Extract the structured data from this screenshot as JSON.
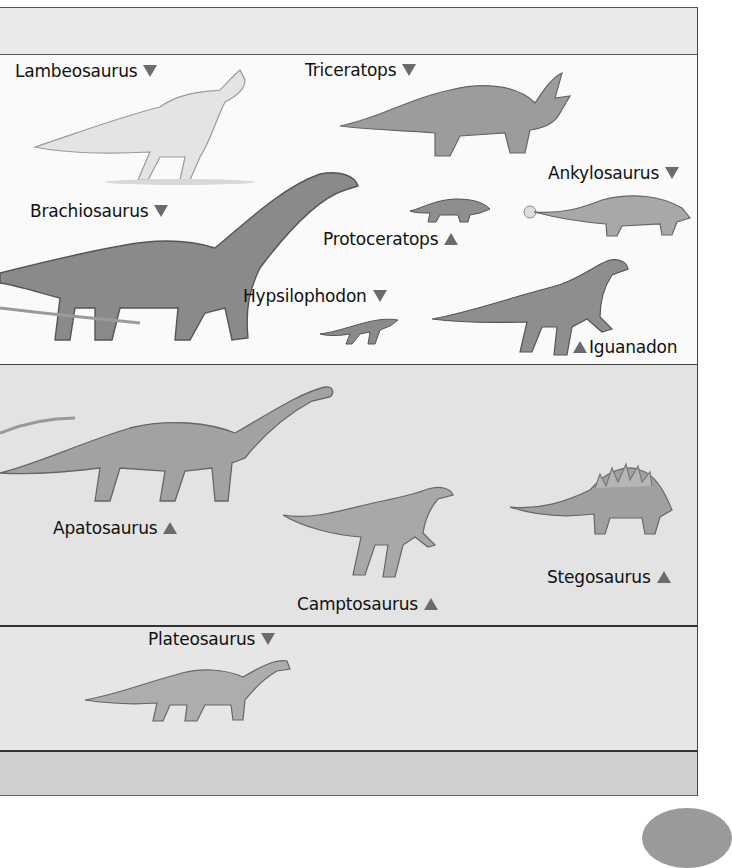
{
  "colors": {
    "arrow": "#6b6b6b",
    "label_text": "#111111",
    "band_top": "#eaeaea",
    "band_1": "#fafafa",
    "band_2": "#e3e3e3",
    "band_3": "#e6e6e6",
    "band_4": "#cfcfcf"
  },
  "bands": [
    {
      "id": "band-1",
      "labels": [
        {
          "name": "Lambeosaurus",
          "arrow": "down"
        },
        {
          "name": "Triceratops",
          "arrow": "down"
        },
        {
          "name": "Ankylosaurus",
          "arrow": "down"
        },
        {
          "name": "Brachiosaurus",
          "arrow": "down"
        },
        {
          "name": "Protoceratops",
          "arrow": "up"
        },
        {
          "name": "Hypsilophodon",
          "arrow": "down"
        },
        {
          "name": "Iguanadon",
          "arrow": "up"
        }
      ]
    },
    {
      "id": "band-2",
      "labels": [
        {
          "name": "Apatosaurus",
          "arrow": "up"
        },
        {
          "name": "Stegosaurus",
          "arrow": "up"
        },
        {
          "name": "Camptosaurus",
          "arrow": "up"
        }
      ]
    },
    {
      "id": "band-3",
      "labels": [
        {
          "name": "Plateosaurus",
          "arrow": "down"
        }
      ]
    }
  ]
}
